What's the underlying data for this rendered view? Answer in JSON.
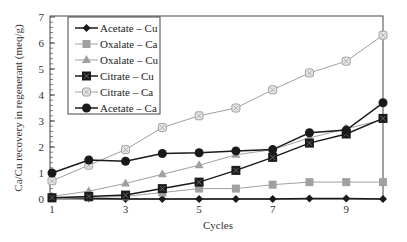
{
  "chart_data": {
    "type": "line",
    "title": "",
    "xlabel": "Cycles",
    "ylabel": "Ca/Cu recovery in regenerant (meq/g)",
    "x": [
      1,
      2,
      3,
      4,
      5,
      6,
      7,
      8,
      9,
      10
    ],
    "xticks": [
      "1",
      "3",
      "5",
      "7",
      "9"
    ],
    "yticks": [
      "0",
      "1",
      "2",
      "3",
      "4",
      "5",
      "6",
      "7"
    ],
    "xlim": [
      1,
      10
    ],
    "ylim": [
      0,
      7
    ],
    "grid": false,
    "legend_position": "upper-left",
    "series": [
      {
        "name": "Acetate – Cu",
        "marker": "diamond",
        "color": "#1a1a1a",
        "values": [
          0.05,
          0.02,
          0.0,
          0.0,
          0.0,
          0.0,
          0.0,
          0.02,
          0.02,
          0.0
        ]
      },
      {
        "name": "Oxalate – Ca",
        "marker": "square",
        "color": "#a0a0a0",
        "values": [
          0.02,
          0.05,
          0.1,
          0.25,
          0.4,
          0.4,
          0.55,
          0.65,
          0.65,
          0.65
        ]
      },
      {
        "name": "Oxalate – Cu",
        "marker": "triangle",
        "color": "#a0a0a0",
        "values": [
          0.1,
          0.3,
          0.6,
          0.95,
          1.3,
          1.7,
          1.9,
          2.35,
          2.7,
          3.05
        ]
      },
      {
        "name": "Citrate – Cu",
        "marker": "square-x",
        "color": "#1a1a1a",
        "values": [
          0.05,
          0.1,
          0.15,
          0.4,
          0.65,
          1.1,
          1.6,
          2.15,
          2.5,
          3.1
        ]
      },
      {
        "name": "Citrate – Ca",
        "marker": "circle-x-light",
        "color": "#a0a0a0",
        "values": [
          0.7,
          1.3,
          1.9,
          2.75,
          3.2,
          3.5,
          4.2,
          4.85,
          5.3,
          6.3
        ]
      },
      {
        "name": "Acetate – Ca",
        "marker": "circle",
        "color": "#1a1a1a",
        "values": [
          1.0,
          1.5,
          1.45,
          1.75,
          1.78,
          1.85,
          1.9,
          2.55,
          2.65,
          3.7
        ]
      }
    ]
  }
}
